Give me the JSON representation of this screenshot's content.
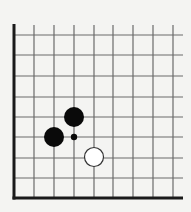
{
  "diagram": {
    "type": "go-board-fragment",
    "corner": "bottom-left",
    "colors": {
      "background": "#f4f4f2",
      "grid_line": "#6a6a6a",
      "edge_line": "#1a1a1a",
      "black_stone": "#0a0a0a",
      "white_stone_fill": "#ffffff",
      "white_stone_stroke": "#333333"
    },
    "grid": {
      "columns_x": [
        14,
        34,
        54,
        74,
        94,
        113,
        133,
        153,
        173
      ],
      "rows_y": [
        35,
        55,
        76,
        97,
        117,
        137,
        158,
        178,
        198
      ],
      "line_end_x": 183,
      "line_start_y": 25
    },
    "stones": [
      {
        "color": "black",
        "col": 3,
        "row": 4,
        "x": 74,
        "y": 117
      },
      {
        "color": "black",
        "col": 2,
        "row": 5,
        "x": 54,
        "y": 137
      },
      {
        "color": "white",
        "col": 4,
        "row": 6,
        "x": 94,
        "y": 157
      }
    ],
    "markers": [
      {
        "type": "small-dot",
        "col": 3,
        "row": 5,
        "x": 74,
        "y": 137
      }
    ]
  }
}
